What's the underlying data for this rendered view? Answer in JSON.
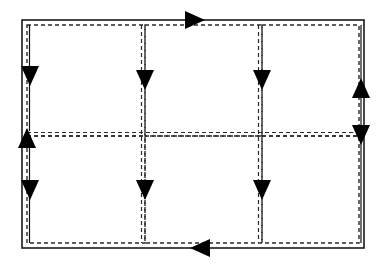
{
  "figure": {
    "type": "routing-flow-diagram",
    "title": "",
    "canvas": {
      "width": 388,
      "height": 267
    },
    "background_color": "#ffffff",
    "line_color": "#1a1a1a",
    "arrow_color": "#000000",
    "outer_border": {
      "style": "solid",
      "stroke_width": 1.6,
      "x": 22,
      "y": 20,
      "width": 342,
      "height": 228
    },
    "inner_path": {
      "style": "dashed",
      "stroke_width": 1.5,
      "dash_pattern": "4 3",
      "inset": 5
    },
    "grid": {
      "columns": 3,
      "rows": 2,
      "column_x": [
        27,
        145,
        262,
        359
      ],
      "row_y": [
        25,
        136,
        243
      ],
      "cell_labels": [
        "",
        "",
        "",
        "",
        "",
        ""
      ]
    },
    "arrows": [
      {
        "id": "top-edge-arrow",
        "direction": "right",
        "x": 205,
        "y": 20,
        "note": "flow entering along top edge"
      },
      {
        "id": "left-col1-arrow",
        "direction": "down",
        "x": 30,
        "y": 76,
        "note": "down left boundary of column 1, row 1"
      },
      {
        "id": "div1-col-row1-arrow",
        "direction": "down",
        "x": 145,
        "y": 80,
        "note": "down divider between column 1 and 2, row 1"
      },
      {
        "id": "div2-col-row1-arrow",
        "direction": "down",
        "x": 262,
        "y": 80,
        "note": "down divider between column 2 and 3, row 1"
      },
      {
        "id": "right-up-arrow",
        "direction": "up",
        "x": 361,
        "y": 88,
        "note": "up along right edge, row 1"
      },
      {
        "id": "right-down-arrow",
        "direction": "down",
        "x": 361,
        "y": 135,
        "note": "down along right edge, toward row 2"
      },
      {
        "id": "left-mid-up-arrow",
        "direction": "up",
        "x": 27,
        "y": 138,
        "note": "up at left edge mid junction"
      },
      {
        "id": "left-col1-row2-arrow",
        "direction": "down",
        "x": 30,
        "y": 190,
        "note": "down left boundary of column 1, row 2"
      },
      {
        "id": "div1-col-row2-arrow",
        "direction": "down",
        "x": 145,
        "y": 190,
        "note": "down divider between column 1 and 2, row 2"
      },
      {
        "id": "div2-col-row2-arrow",
        "direction": "down",
        "x": 262,
        "y": 190,
        "note": "down divider between column 2 and 3, row 2"
      },
      {
        "id": "bottom-edge-arrow",
        "direction": "left",
        "x": 190,
        "y": 248,
        "note": "flow exiting along bottom edge"
      }
    ],
    "arrow_head": {
      "length": 20,
      "half_width": 9
    }
  }
}
